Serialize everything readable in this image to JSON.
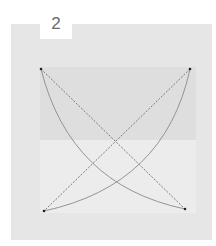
{
  "step": {
    "number": "2"
  },
  "diagram": {
    "colors": {
      "background": "#ffffff",
      "panel": "#e6e6e6",
      "paper_top": "#dedede",
      "paper_bottom": "#ececec",
      "line": "#7a7a7a",
      "dot": "#222222"
    },
    "corners": [
      {
        "name": "top-left",
        "x": 41,
        "y": 69
      },
      {
        "name": "top-right",
        "x": 190,
        "y": 69
      },
      {
        "name": "bottom-left",
        "x": 44,
        "y": 211
      },
      {
        "name": "bottom-right",
        "x": 185,
        "y": 209
      }
    ]
  }
}
